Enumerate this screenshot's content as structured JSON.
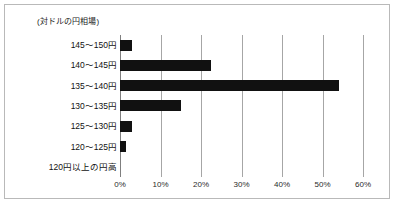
{
  "chart_data": {
    "type": "bar",
    "orientation": "horizontal",
    "title": "(対ドルの円相場)",
    "xlabel": "",
    "ylabel": "",
    "xlim": [
      0,
      60
    ],
    "xticks": [
      "0%",
      "10%",
      "20%",
      "30%",
      "40%",
      "50%",
      "60%"
    ],
    "xtick_values": [
      0,
      10,
      20,
      30,
      40,
      50,
      60
    ],
    "grid": true,
    "legend": false,
    "bar_color": "#111111",
    "gridline_color": "#a6a6a6",
    "border_color": "#b9b9b9",
    "categories": [
      "145〜150円",
      "140〜145円",
      "135〜140円",
      "130〜135円",
      "125〜130円",
      "120〜125円",
      "120円以上の円高"
    ],
    "values": [
      3.0,
      22.5,
      54.0,
      15.0,
      3.0,
      1.5,
      0
    ]
  }
}
